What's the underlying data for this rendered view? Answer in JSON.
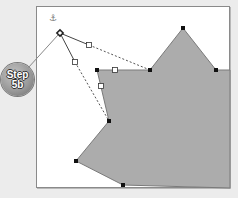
{
  "badge": {
    "line1": "Step",
    "line2": "5b"
  },
  "canvas": {
    "background": "#ffffff",
    "border_color": "#8a8a8a"
  },
  "shape": {
    "fill": "#acacac",
    "stroke": "#7a7a7a",
    "points": "97,70 150,70 183,28 216,70 230,70 230,188 123,185 76,161 109,121"
  },
  "cursor": {
    "icon": "anchor-point-icon",
    "glyph": "⚓",
    "x": 52,
    "y": 18,
    "pen_x": 60,
    "pen_y": 33
  },
  "vertices": [
    {
      "x": 97,
      "y": 70
    },
    {
      "x": 150,
      "y": 70
    },
    {
      "x": 183,
      "y": 28
    },
    {
      "x": 216,
      "y": 70
    },
    {
      "x": 109,
      "y": 121
    },
    {
      "x": 76,
      "y": 161
    },
    {
      "x": 123,
      "y": 185
    }
  ],
  "handles": [
    {
      "x": 89,
      "y": 45
    },
    {
      "x": 75,
      "y": 62
    },
    {
      "x": 115,
      "y": 70
    },
    {
      "x": 101,
      "y": 86
    }
  ],
  "colors": {
    "vertex": "#111111",
    "handle_fill": "#ffffff",
    "handle_stroke": "#333333",
    "guide": "#555555"
  }
}
